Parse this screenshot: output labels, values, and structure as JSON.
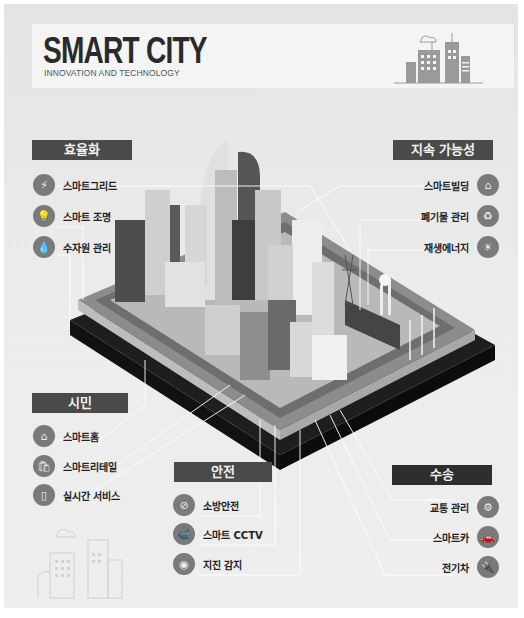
{
  "header": {
    "title": "SMART CITY",
    "subtitle": "INNOVATION AND TECHNOLOGY",
    "illustration": "city-skyline-icon"
  },
  "sections": {
    "efficiency": {
      "title": "효율화",
      "items": [
        {
          "label": "스마트그리드",
          "icon": "power-tower-icon"
        },
        {
          "label": "스마트 조명",
          "icon": "light-bulb-icon"
        },
        {
          "label": "수자원 관리",
          "icon": "water-tap-icon"
        }
      ]
    },
    "sustainability": {
      "title": "지속 가능성",
      "items": [
        {
          "label": "스마트빌딩",
          "icon": "smart-house-icon"
        },
        {
          "label": "폐기물 관리",
          "icon": "recycle-bin-icon"
        },
        {
          "label": "재생에너지",
          "icon": "solar-panel-icon"
        }
      ]
    },
    "citizens": {
      "title": "시민",
      "items": [
        {
          "label": "스마트홈",
          "icon": "smart-home-icon"
        },
        {
          "label": "스마트리테일",
          "icon": "shopping-bag-icon"
        },
        {
          "label": "실시간 서비스",
          "icon": "mobile-phone-icon"
        }
      ]
    },
    "safety": {
      "title": "안전",
      "items": [
        {
          "label": "소방안전",
          "icon": "no-fire-icon"
        },
        {
          "label": "스마트 CCTV",
          "icon": "cctv-camera-icon"
        },
        {
          "label": "지진 감지",
          "icon": "earthquake-sensor-icon"
        }
      ]
    },
    "transport": {
      "title": "수송",
      "items": [
        {
          "label": "교통 관리",
          "icon": "traffic-control-icon"
        },
        {
          "label": "스마트카",
          "icon": "smart-car-icon"
        },
        {
          "label": "전기차",
          "icon": "electric-car-icon"
        }
      ]
    }
  },
  "colors": {
    "background": "#ececec",
    "label_box": "#4a4a4a",
    "label_box_dark": "#2e2e2e",
    "icon_circle": "#7a7a7a",
    "connector": "#ffffff"
  }
}
